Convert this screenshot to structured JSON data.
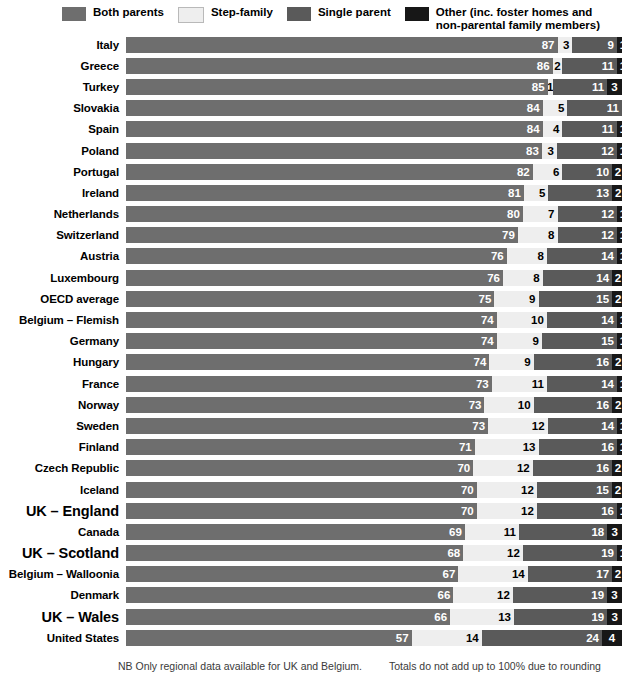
{
  "legend": {
    "items": [
      {
        "label": "Both parents",
        "color": "#6e6e6e",
        "icon": "legend-swatch-both-parents"
      },
      {
        "label": "Step-family",
        "color": "#eeeeee",
        "icon": "legend-swatch-step-family"
      },
      {
        "label": "Single parent",
        "color": "#5a5a5a",
        "icon": "legend-swatch-single-parent"
      },
      {
        "label": "Other (inc. foster homes and\nnon-parental family members)",
        "color": "#171717",
        "icon": "legend-swatch-other"
      }
    ]
  },
  "footer": {
    "left": "NB Only regional data available for UK and Belgium.",
    "right": "Totals do not add up to 100% due to rounding"
  },
  "chart_data": {
    "type": "bar",
    "orientation": "horizontal",
    "stacked": true,
    "title": "",
    "subtitle": "",
    "xlabel": "",
    "ylabel": "",
    "xlim": [
      0,
      100
    ],
    "grid": false,
    "legend_position": "top",
    "units": "percent",
    "series": [
      {
        "name": "Both parents",
        "color": "#6e6e6e"
      },
      {
        "name": "Step-family",
        "color": "#eeeeee"
      },
      {
        "name": "Single parent",
        "color": "#5a5a5a"
      },
      {
        "name": "Other (inc. foster homes and non-parental family members)",
        "color": "#171717"
      }
    ],
    "categories": [
      "Italy",
      "Greece",
      "Turkey",
      "Slovakia",
      "Spain",
      "Poland",
      "Portugal",
      "Ireland",
      "Netherlands",
      "Switzerland",
      "Austria",
      "Luxembourg",
      "OECD average",
      "Belgium – Flemish",
      "Germany",
      "Hungary",
      "France",
      "Norway",
      "Sweden",
      "Finland",
      "Czech Republic",
      "Iceland",
      "UK – England",
      "Canada",
      "UK – Scotland",
      "Belgium – Walloonia",
      "Denmark",
      "UK – Wales",
      "United States"
    ],
    "highlight_categories": [
      "UK – England",
      "UK – Scotland",
      "UK – Wales"
    ],
    "rows": [
      {
        "category": "Italy",
        "highlight": false,
        "values": [
          87,
          3,
          9,
          1
        ]
      },
      {
        "category": "Greece",
        "highlight": false,
        "values": [
          86,
          2,
          11,
          1
        ]
      },
      {
        "category": "Turkey",
        "highlight": false,
        "values": [
          85,
          1,
          11,
          3
        ]
      },
      {
        "category": "Slovakia",
        "highlight": false,
        "values": [
          84,
          5,
          11,
          0
        ]
      },
      {
        "category": "Spain",
        "highlight": false,
        "values": [
          84,
          4,
          11,
          1
        ]
      },
      {
        "category": "Poland",
        "highlight": false,
        "values": [
          83,
          3,
          12,
          1
        ]
      },
      {
        "category": "Portugal",
        "highlight": false,
        "values": [
          82,
          6,
          10,
          2
        ]
      },
      {
        "category": "Ireland",
        "highlight": false,
        "values": [
          81,
          5,
          13,
          2
        ]
      },
      {
        "category": "Netherlands",
        "highlight": false,
        "values": [
          80,
          7,
          12,
          1
        ]
      },
      {
        "category": "Switzerland",
        "highlight": false,
        "values": [
          79,
          8,
          12,
          1
        ]
      },
      {
        "category": "Austria",
        "highlight": false,
        "values": [
          76,
          8,
          14,
          1
        ]
      },
      {
        "category": "Luxembourg",
        "highlight": false,
        "values": [
          76,
          8,
          14,
          2
        ]
      },
      {
        "category": "OECD average",
        "highlight": false,
        "values": [
          75,
          9,
          15,
          2
        ]
      },
      {
        "category": "Belgium – Flemish",
        "highlight": false,
        "values": [
          74,
          10,
          14,
          1
        ]
      },
      {
        "category": "Germany",
        "highlight": false,
        "values": [
          74,
          9,
          15,
          1
        ]
      },
      {
        "category": "Hungary",
        "highlight": false,
        "values": [
          74,
          9,
          16,
          2
        ]
      },
      {
        "category": "France",
        "highlight": false,
        "values": [
          73,
          11,
          14,
          1
        ]
      },
      {
        "category": "Norway",
        "highlight": false,
        "values": [
          73,
          10,
          16,
          2
        ]
      },
      {
        "category": "Sweden",
        "highlight": false,
        "values": [
          73,
          12,
          14,
          1
        ]
      },
      {
        "category": "Finland",
        "highlight": false,
        "values": [
          71,
          13,
          16,
          1
        ]
      },
      {
        "category": "Czech Republic",
        "highlight": false,
        "values": [
          70,
          12,
          16,
          2
        ]
      },
      {
        "category": "Iceland",
        "highlight": false,
        "values": [
          70,
          12,
          15,
          2
        ]
      },
      {
        "category": "UK – England",
        "highlight": true,
        "values": [
          70,
          12,
          16,
          1
        ]
      },
      {
        "category": "Canada",
        "highlight": false,
        "values": [
          69,
          11,
          18,
          3
        ]
      },
      {
        "category": "UK – Scotland",
        "highlight": true,
        "values": [
          68,
          12,
          19,
          1
        ]
      },
      {
        "category": "Belgium – Walloonia",
        "highlight": false,
        "values": [
          67,
          14,
          17,
          2
        ]
      },
      {
        "category": "Denmark",
        "highlight": false,
        "values": [
          66,
          12,
          19,
          3
        ]
      },
      {
        "category": "UK – Wales",
        "highlight": true,
        "values": [
          66,
          13,
          19,
          3
        ]
      },
      {
        "category": "United States",
        "highlight": false,
        "values": [
          57,
          14,
          24,
          4
        ]
      }
    ]
  }
}
